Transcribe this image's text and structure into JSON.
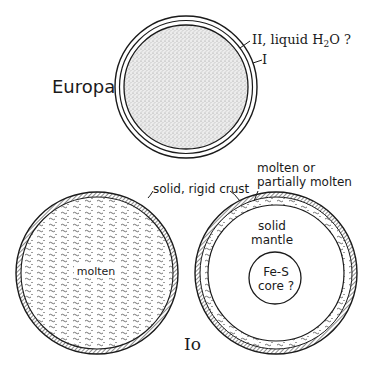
{
  "diagram": {
    "europa": {
      "title": "Europa",
      "layer_I_label": "I",
      "layer_II_label": "II, liquid H",
      "layer_II_sub": "2",
      "layer_II_tail": "O ?"
    },
    "io": {
      "title": "Io",
      "left_model": {
        "crust_label": "solid, rigid crust",
        "interior_label": "molten"
      },
      "right_model": {
        "layer_label_line1": "molten or",
        "layer_label_line2": "partially molten",
        "mantle_label_line1": "solid",
        "mantle_label_line2": "mantle",
        "core_label_line1": "Fe-S",
        "core_label_line2": "core ?"
      }
    },
    "colors": {
      "ink": "#1a1a1a",
      "stipple": "#bdbdbd",
      "background": "#ffffff"
    }
  }
}
